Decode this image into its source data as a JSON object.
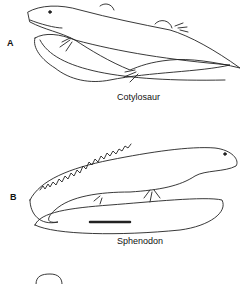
{
  "figure": {
    "panels": [
      {
        "letter": "A",
        "caption": "Cotylosaur"
      },
      {
        "letter": "B",
        "caption": "Sphenodon"
      }
    ]
  }
}
